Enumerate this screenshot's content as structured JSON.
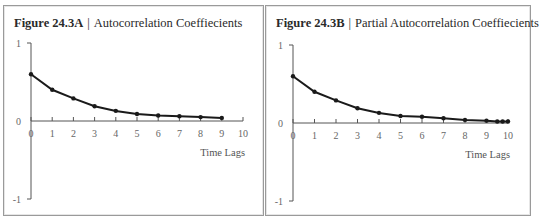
{
  "figures": [
    {
      "id": "a",
      "figure_label": "Figure 24.3A",
      "separator": "|",
      "title": "Autocorrelation Coeffiecients",
      "x_axis_title": "Time Lags",
      "y_tick_labels": [
        "1",
        "0",
        "-1"
      ],
      "x_tick_labels": [
        "0",
        "1",
        "2",
        "3",
        "4",
        "5",
        "6",
        "7",
        "8",
        "9",
        "10"
      ]
    },
    {
      "id": "b",
      "figure_label": "Figure 24.3B",
      "separator": "|",
      "title": "Partial Autocorrelation Coeffiecients",
      "x_axis_title": "Time Lags",
      "y_tick_labels": [
        "1",
        "0",
        "-1"
      ],
      "x_tick_labels": [
        "0",
        "1",
        "2",
        "3",
        "4",
        "5",
        "6",
        "7",
        "8",
        "9",
        "10"
      ]
    }
  ],
  "colors": {
    "line": "#1a1a1a",
    "axis": "#555555",
    "frame": "#9a9a9a"
  },
  "chart_data": [
    {
      "type": "line",
      "title": "Figure 24.3A | Autocorrelation Coeffiecients",
      "xlabel": "Time Lags",
      "ylabel": "",
      "xlim": [
        0,
        10
      ],
      "ylim": [
        -1,
        1
      ],
      "x_ticks": [
        0,
        1,
        2,
        3,
        4,
        5,
        6,
        7,
        8,
        9,
        10
      ],
      "y_ticks": [
        -1,
        0,
        1
      ],
      "grid": false,
      "legend": null,
      "series": [
        {
          "name": "Autocorrelation",
          "x": [
            0,
            1,
            2,
            3,
            4,
            5,
            6,
            7,
            8,
            9
          ],
          "values": [
            0.6,
            0.4,
            0.29,
            0.19,
            0.13,
            0.09,
            0.07,
            0.06,
            0.05,
            0.04
          ]
        }
      ]
    },
    {
      "type": "line",
      "title": "Figure 24.3B | Partial Autocorrelation Coeffiecients",
      "xlabel": "Time Lags",
      "ylabel": "",
      "xlim": [
        0,
        10
      ],
      "ylim": [
        -1,
        1
      ],
      "x_ticks": [
        0,
        1,
        2,
        3,
        4,
        5,
        6,
        7,
        8,
        9,
        10
      ],
      "y_ticks": [
        -1,
        0,
        1
      ],
      "grid": false,
      "legend": null,
      "series": [
        {
          "name": "Partial Autocorrelation",
          "x": [
            0,
            1,
            2,
            3,
            4,
            5,
            6,
            7,
            8,
            9,
            9.5,
            9.75,
            10
          ],
          "values": [
            0.6,
            0.4,
            0.29,
            0.19,
            0.13,
            0.09,
            0.08,
            0.06,
            0.04,
            0.03,
            0.02,
            0.02,
            0.02
          ]
        }
      ]
    }
  ]
}
